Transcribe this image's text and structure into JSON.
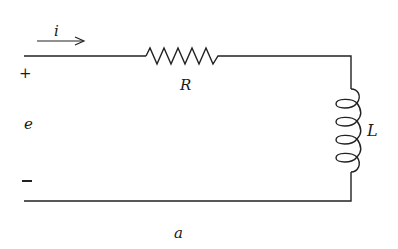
{
  "diagram": {
    "type": "RL series circuit",
    "labels": {
      "current": "i",
      "resistor": "R",
      "inductor": "L",
      "source": "e",
      "plus": "+",
      "minus": "−",
      "caption": "a"
    },
    "components": [
      {
        "id": "resistor",
        "symbol": "zigzag",
        "label": "R"
      },
      {
        "id": "inductor",
        "symbol": "coil",
        "label": "L",
        "turns": 4
      }
    ],
    "colors": {
      "line": "#222222",
      "background": "#ffffff"
    }
  }
}
